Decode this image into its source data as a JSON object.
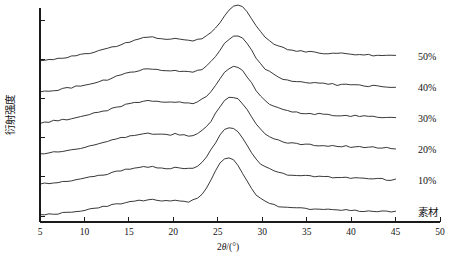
{
  "chart_data": {
    "type": "line",
    "title": "",
    "xlabel": "2θ/(°)",
    "ylabel": "衍射强度",
    "xlim": [
      5,
      50
    ],
    "xticks": [
      5,
      10,
      15,
      20,
      25,
      30,
      35,
      40,
      45,
      50
    ],
    "xticklabels": [
      "5",
      "10",
      "15",
      "20",
      "25",
      "30",
      "35",
      "40",
      "45",
      "50"
    ],
    "ylim": [
      0,
      1
    ],
    "yticks_count": 6,
    "yticklabels": [],
    "grid": false,
    "legend_position": "right-inline",
    "x_domain_data": [
      5,
      45
    ],
    "series": [
      {
        "name": "50%",
        "label": "50%",
        "offset_index": 5,
        "peak_positions": [
          16.6,
          22.3
        ],
        "peak_relative_heights": [
          0.42,
          1.0
        ],
        "values": [
          0.04,
          0.05,
          0.06,
          0.07,
          0.08,
          0.1,
          0.11,
          0.12,
          0.14,
          0.15,
          0.17,
          0.18,
          0.2,
          0.22,
          0.24,
          0.26,
          0.28,
          0.3,
          0.33,
          0.35,
          0.38,
          0.4,
          0.42,
          0.44,
          0.45,
          0.45,
          0.44,
          0.43,
          0.42,
          0.42,
          0.43,
          0.42,
          0.41,
          0.4,
          0.4,
          0.41,
          0.43,
          0.47,
          0.53,
          0.61,
          0.71,
          0.82,
          0.92,
          0.98,
          1.0,
          0.97,
          0.89,
          0.78,
          0.66,
          0.55,
          0.46,
          0.39,
          0.34,
          0.3,
          0.27,
          0.25,
          0.23,
          0.22,
          0.21,
          0.2,
          0.2,
          0.19,
          0.19,
          0.18,
          0.18,
          0.17,
          0.17,
          0.17,
          0.16,
          0.16,
          0.16,
          0.15,
          0.15,
          0.15,
          0.14,
          0.14,
          0.14,
          0.13,
          0.13,
          0.13
        ]
      },
      {
        "name": "40%",
        "label": "40%",
        "offset_index": 4,
        "peak_positions": [
          16.8,
          22.3
        ],
        "peak_relative_heights": [
          0.4,
          1.0
        ],
        "values": [
          0.03,
          0.04,
          0.05,
          0.06,
          0.07,
          0.09,
          0.1,
          0.11,
          0.13,
          0.14,
          0.16,
          0.17,
          0.19,
          0.21,
          0.23,
          0.25,
          0.27,
          0.3,
          0.32,
          0.35,
          0.37,
          0.39,
          0.41,
          0.42,
          0.43,
          0.43,
          0.42,
          0.41,
          0.4,
          0.4,
          0.41,
          0.4,
          0.39,
          0.38,
          0.38,
          0.4,
          0.43,
          0.48,
          0.56,
          0.65,
          0.76,
          0.87,
          0.95,
          0.99,
          1.0,
          0.96,
          0.87,
          0.75,
          0.63,
          0.52,
          0.44,
          0.38,
          0.33,
          0.29,
          0.26,
          0.24,
          0.22,
          0.21,
          0.2,
          0.2,
          0.19,
          0.19,
          0.18,
          0.18,
          0.17,
          0.17,
          0.16,
          0.16,
          0.16,
          0.15,
          0.15,
          0.15,
          0.14,
          0.14,
          0.14,
          0.13,
          0.13,
          0.13,
          0.12,
          0.12
        ]
      },
      {
        "name": "30%",
        "label": "30%",
        "offset_index": 3,
        "peak_positions": [
          16.9,
          22.4
        ],
        "peak_relative_heights": [
          0.38,
          1.0
        ],
        "values": [
          0.03,
          0.04,
          0.05,
          0.06,
          0.07,
          0.08,
          0.09,
          0.11,
          0.12,
          0.14,
          0.15,
          0.17,
          0.19,
          0.21,
          0.23,
          0.25,
          0.27,
          0.29,
          0.32,
          0.34,
          0.36,
          0.38,
          0.39,
          0.4,
          0.41,
          0.41,
          0.4,
          0.39,
          0.38,
          0.38,
          0.39,
          0.38,
          0.37,
          0.36,
          0.37,
          0.39,
          0.43,
          0.49,
          0.57,
          0.68,
          0.79,
          0.9,
          0.97,
          1.0,
          0.99,
          0.93,
          0.83,
          0.71,
          0.59,
          0.49,
          0.41,
          0.35,
          0.31,
          0.28,
          0.25,
          0.23,
          0.22,
          0.21,
          0.2,
          0.19,
          0.19,
          0.18,
          0.18,
          0.17,
          0.17,
          0.16,
          0.16,
          0.16,
          0.15,
          0.15,
          0.15,
          0.14,
          0.14,
          0.14,
          0.13,
          0.13,
          0.13,
          0.12,
          0.12,
          0.12
        ]
      },
      {
        "name": "20%",
        "label": "20%",
        "offset_index": 2,
        "peak_positions": [
          17.0,
          22.4
        ],
        "peak_relative_heights": [
          0.34,
          1.0
        ],
        "values": [
          0.02,
          0.03,
          0.04,
          0.05,
          0.06,
          0.07,
          0.08,
          0.1,
          0.11,
          0.12,
          0.14,
          0.15,
          0.17,
          0.19,
          0.21,
          0.23,
          0.25,
          0.27,
          0.29,
          0.31,
          0.33,
          0.34,
          0.35,
          0.36,
          0.37,
          0.37,
          0.36,
          0.35,
          0.35,
          0.35,
          0.36,
          0.35,
          0.34,
          0.33,
          0.34,
          0.37,
          0.42,
          0.49,
          0.59,
          0.71,
          0.83,
          0.93,
          0.99,
          1.0,
          0.97,
          0.89,
          0.78,
          0.65,
          0.54,
          0.44,
          0.37,
          0.32,
          0.28,
          0.25,
          0.23,
          0.21,
          0.2,
          0.19,
          0.19,
          0.18,
          0.18,
          0.17,
          0.17,
          0.16,
          0.16,
          0.16,
          0.15,
          0.15,
          0.15,
          0.14,
          0.14,
          0.14,
          0.13,
          0.13,
          0.13,
          0.12,
          0.12,
          0.12,
          0.11,
          0.11
        ]
      },
      {
        "name": "10%",
        "label": "10%",
        "offset_index": 1,
        "peak_positions": [
          17.0,
          22.5
        ],
        "peak_relative_heights": [
          0.3,
          1.0
        ],
        "values": [
          0.02,
          0.03,
          0.04,
          0.04,
          0.05,
          0.06,
          0.07,
          0.08,
          0.1,
          0.11,
          0.12,
          0.14,
          0.15,
          0.17,
          0.18,
          0.2,
          0.22,
          0.24,
          0.26,
          0.28,
          0.29,
          0.3,
          0.31,
          0.32,
          0.32,
          0.32,
          0.31,
          0.31,
          0.3,
          0.3,
          0.31,
          0.3,
          0.29,
          0.29,
          0.3,
          0.34,
          0.4,
          0.49,
          0.61,
          0.74,
          0.87,
          0.96,
          1.0,
          0.99,
          0.93,
          0.83,
          0.7,
          0.57,
          0.46,
          0.38,
          0.32,
          0.28,
          0.25,
          0.22,
          0.21,
          0.19,
          0.18,
          0.18,
          0.17,
          0.17,
          0.16,
          0.16,
          0.16,
          0.15,
          0.15,
          0.14,
          0.14,
          0.14,
          0.13,
          0.13,
          0.13,
          0.12,
          0.12,
          0.12,
          0.11,
          0.11,
          0.11,
          0.1,
          0.1,
          0.1
        ]
      },
      {
        "name": "素材",
        "label": "素材",
        "offset_index": 0,
        "peak_positions": [
          17.2,
          22.5
        ],
        "peak_relative_heights": [
          0.26,
          1.0
        ],
        "values": [
          0.02,
          0.02,
          0.03,
          0.04,
          0.04,
          0.05,
          0.06,
          0.07,
          0.08,
          0.09,
          0.1,
          0.12,
          0.13,
          0.14,
          0.16,
          0.17,
          0.19,
          0.2,
          0.22,
          0.24,
          0.25,
          0.26,
          0.27,
          0.27,
          0.28,
          0.28,
          0.27,
          0.27,
          0.26,
          0.26,
          0.27,
          0.26,
          0.25,
          0.25,
          0.27,
          0.31,
          0.38,
          0.49,
          0.63,
          0.78,
          0.91,
          0.99,
          1.0,
          0.96,
          0.87,
          0.74,
          0.6,
          0.47,
          0.37,
          0.3,
          0.25,
          0.22,
          0.19,
          0.17,
          0.16,
          0.15,
          0.14,
          0.14,
          0.13,
          0.13,
          0.12,
          0.12,
          0.12,
          0.11,
          0.11,
          0.11,
          0.1,
          0.1,
          0.1,
          0.1,
          0.09,
          0.09,
          0.09,
          0.09,
          0.08,
          0.08,
          0.08,
          0.08,
          0.07,
          0.07
        ]
      }
    ]
  },
  "axes": {
    "x_title": "2θ/(°)",
    "x_title_prefix": "2",
    "x_title_theta": "θ",
    "x_title_suffix": "/(°)",
    "y_title": "衍射强度",
    "xticklabels": [
      "5",
      "10",
      "15",
      "20",
      "25",
      "30",
      "35",
      "40",
      "45",
      "50"
    ]
  },
  "series_labels": [
    "50%",
    "40%",
    "30%",
    "20%",
    "10%",
    "素材"
  ]
}
